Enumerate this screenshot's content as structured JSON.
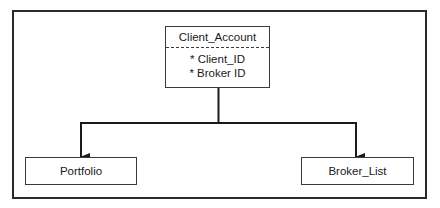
{
  "diagram": {
    "type": "entity-hierarchy",
    "root": {
      "name": "Client_Account",
      "attributes": [
        "* Client_ID",
        "* Broker ID"
      ]
    },
    "children": [
      {
        "name": "Portfolio"
      },
      {
        "name": "Broker_List"
      }
    ],
    "edges": [
      {
        "from": "Client_Account",
        "to": "Portfolio",
        "style": "arrow"
      },
      {
        "from": "Client_Account",
        "to": "Broker_List",
        "style": "arrow"
      }
    ],
    "colors": {
      "line": "#2a2a2a",
      "background": "#ffffff",
      "text": "#1a1a1a"
    }
  }
}
